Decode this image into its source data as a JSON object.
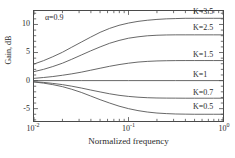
{
  "chart_data": {
    "type": "line",
    "title": "",
    "xlabel": "Normalized frequency",
    "ylabel": "Gain, dB",
    "xscale": "log",
    "xlim": [
      0.01,
      1.0
    ],
    "ylim": [
      -7.2,
      12.4
    ],
    "grid": false,
    "legend_position": "inline-right-of-curves",
    "annotations": [
      {
        "text": "α=0.9",
        "x": 0.013,
        "y": 11.0
      }
    ],
    "xticks": [
      {
        "value": 0.01,
        "label": "10",
        "exponent": "-2"
      },
      {
        "value": 0.1,
        "label": "10",
        "exponent": "-1"
      },
      {
        "value": 1.0,
        "label": "10",
        "exponent": "0"
      }
    ],
    "yticks": [
      {
        "value": 10,
        "label": "10"
      },
      {
        "value": 5,
        "label": "5"
      },
      {
        "value": 0,
        "label": "0"
      },
      {
        "value": -5,
        "label": "-5"
      }
    ],
    "series": [
      {
        "name": "K=3.5",
        "label": "K=3.5",
        "color": "#555555",
        "label_y": 11.0,
        "x": [
          0.01,
          0.0126,
          0.0158,
          0.02,
          0.0251,
          0.0316,
          0.0398,
          0.0501,
          0.0631,
          0.0794,
          0.1,
          0.126,
          0.158,
          0.2,
          0.251,
          0.316,
          0.398,
          0.501,
          0.631,
          0.794,
          1.0
        ],
        "y": [
          2.95,
          3.55,
          4.25,
          5.05,
          5.95,
          6.85,
          7.75,
          8.6,
          9.3,
          9.85,
          10.25,
          10.55,
          10.75,
          10.9,
          11.0,
          11.05,
          11.1,
          11.1,
          11.1,
          11.1,
          11.1
        ]
      },
      {
        "name": "K=2.5",
        "label": "K=2.5",
        "color": "#555555",
        "label_y": 8.15,
        "x": [
          0.01,
          0.0126,
          0.0158,
          0.02,
          0.0251,
          0.0316,
          0.0398,
          0.0501,
          0.0631,
          0.0794,
          0.1,
          0.126,
          0.158,
          0.2,
          0.251,
          0.316,
          0.398,
          0.501,
          0.631,
          0.794,
          1.0
        ],
        "y": [
          1.6,
          2.0,
          2.5,
          3.1,
          3.8,
          4.55,
          5.3,
          6.0,
          6.65,
          7.15,
          7.55,
          7.8,
          7.98,
          8.08,
          8.13,
          8.15,
          8.15,
          8.15,
          8.15,
          8.15,
          8.15
        ]
      },
      {
        "name": "K=1.5",
        "label": "K=1.5",
        "color": "#555555",
        "label_y": 3.55,
        "x": [
          0.01,
          0.0126,
          0.0158,
          0.02,
          0.0251,
          0.0316,
          0.0398,
          0.0501,
          0.0631,
          0.0794,
          0.1,
          0.126,
          0.158,
          0.2,
          0.251,
          0.316,
          0.398,
          0.501,
          0.631,
          0.794,
          1.0
        ],
        "y": [
          0.4,
          0.55,
          0.72,
          0.95,
          1.2,
          1.5,
          1.85,
          2.2,
          2.55,
          2.85,
          3.1,
          3.3,
          3.42,
          3.5,
          3.54,
          3.56,
          3.57,
          3.57,
          3.57,
          3.57,
          3.57
        ]
      },
      {
        "name": "K=1",
        "label": "K=1",
        "color": "#555555",
        "label_y": 0.05,
        "x": [
          0.01,
          0.0316,
          0.1,
          0.316,
          1.0
        ],
        "y": [
          0.0,
          0.0,
          0.0,
          0.0,
          0.0
        ]
      },
      {
        "name": "K=0.7",
        "label": "K=0.7",
        "color": "#555555",
        "label_y": -3.1,
        "x": [
          0.01,
          0.0126,
          0.0158,
          0.02,
          0.0251,
          0.0316,
          0.0398,
          0.0501,
          0.0631,
          0.0794,
          0.1,
          0.126,
          0.158,
          0.2,
          0.251,
          0.316,
          0.398,
          0.501,
          0.631,
          0.794,
          1.0
        ],
        "y": [
          -0.2,
          -0.32,
          -0.5,
          -0.72,
          -1.0,
          -1.32,
          -1.68,
          -2.02,
          -2.35,
          -2.62,
          -2.82,
          -2.96,
          -3.05,
          -3.1,
          -3.12,
          -3.13,
          -3.14,
          -3.14,
          -3.14,
          -3.14,
          -3.14
        ]
      },
      {
        "name": "K=0.5",
        "label": "K=0.5",
        "color": "#555555",
        "label_y": -5.7,
        "x": [
          0.01,
          0.0126,
          0.0158,
          0.02,
          0.0251,
          0.0316,
          0.0398,
          0.0501,
          0.0631,
          0.0794,
          0.1,
          0.126,
          0.158,
          0.2,
          0.251,
          0.316,
          0.398,
          0.501,
          0.631,
          0.794,
          1.0
        ],
        "y": [
          -0.25,
          -0.45,
          -0.72,
          -1.08,
          -1.55,
          -2.1,
          -2.75,
          -3.4,
          -4.0,
          -4.55,
          -5.0,
          -5.35,
          -5.6,
          -5.78,
          -5.88,
          -5.95,
          -5.98,
          -6.0,
          -6.0,
          -6.0,
          -6.0
        ]
      }
    ]
  }
}
